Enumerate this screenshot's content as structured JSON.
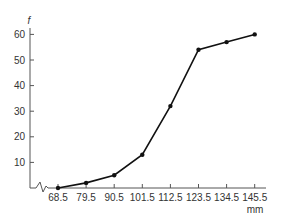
{
  "chart_data": {
    "type": "line",
    "title": "",
    "xlabel": "mm",
    "ylabel": "f",
    "x": [
      68.5,
      79.5,
      90.5,
      101.5,
      112.5,
      123.5,
      134.5,
      145.5
    ],
    "categories": [
      "68.5",
      "79.5",
      "90.5",
      "101.5",
      "112.5",
      "123.5",
      "134.5",
      "145.5"
    ],
    "series": [
      {
        "name": "cumulative frequency",
        "values": [
          0,
          2,
          5,
          13,
          32,
          54,
          57,
          60
        ]
      }
    ],
    "yticks": [
      "10",
      "20",
      "30",
      "40",
      "50",
      "60"
    ],
    "ylim": [
      0,
      60
    ],
    "xlim": [
      68.5,
      145.5
    ],
    "grid": false,
    "legend": "none",
    "annotations": [
      "axis break on x-axis near origin"
    ],
    "colors": {
      "line": "#111111",
      "axis": "#555555",
      "text": "#333333"
    }
  }
}
